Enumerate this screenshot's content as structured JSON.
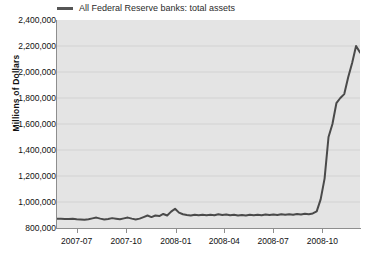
{
  "chart_data": {
    "type": "line",
    "title": "",
    "subtitle": "",
    "xlabel": "",
    "ylabel": "Millions of Dollars",
    "legend": {
      "position": "top-left",
      "entries": [
        {
          "name": "All Federal Reserve banks: total assets",
          "color": "#555555"
        }
      ]
    },
    "grid": {
      "horizontal": true,
      "vertical": false,
      "color": "#d2d2d2"
    },
    "plot_background": "#e4e4e4",
    "page_background": "#ffffff",
    "xlim": [
      "2007-06-06",
      "2008-11-26"
    ],
    "ylim": [
      800000,
      2400000
    ],
    "yticks": [
      "800,000",
      "1,000,000",
      "1,200,000",
      "1,400,000",
      "1,600,000",
      "1,800,000",
      "2,000,000",
      "2,200,000",
      "2,400,000"
    ],
    "ytick_values": [
      800000,
      1000000,
      1200000,
      1400000,
      1600000,
      1800000,
      2000000,
      2200000,
      2400000
    ],
    "xticks": [
      "2007-07",
      "2007-10",
      "2008-01",
      "2008-04",
      "2008-07",
      "2008-10"
    ],
    "xtick_positions": [
      0.065,
      0.228,
      0.392,
      0.552,
      0.713,
      0.876
    ],
    "series": [
      {
        "name": "All Federal Reserve banks: total assets",
        "color": "#4a4a4a",
        "line_width": 2,
        "x": [
          "2007-06-06",
          "2007-06-13",
          "2007-06-20",
          "2007-06-27",
          "2007-07-04",
          "2007-07-11",
          "2007-07-18",
          "2007-07-25",
          "2007-08-01",
          "2007-08-08",
          "2007-08-15",
          "2007-08-22",
          "2007-08-29",
          "2007-09-05",
          "2007-09-12",
          "2007-09-19",
          "2007-09-26",
          "2007-10-03",
          "2007-10-10",
          "2007-10-17",
          "2007-10-24",
          "2007-10-31",
          "2007-11-07",
          "2007-11-14",
          "2007-11-21",
          "2007-11-28",
          "2007-12-05",
          "2007-12-12",
          "2007-12-19",
          "2007-12-26",
          "2008-01-02",
          "2008-01-09",
          "2008-01-16",
          "2008-01-23",
          "2008-01-30",
          "2008-02-06",
          "2008-02-13",
          "2008-02-20",
          "2008-02-27",
          "2008-03-05",
          "2008-03-12",
          "2008-03-19",
          "2008-03-26",
          "2008-04-02",
          "2008-04-09",
          "2008-04-16",
          "2008-04-23",
          "2008-04-30",
          "2008-05-07",
          "2008-05-14",
          "2008-05-21",
          "2008-05-28",
          "2008-06-04",
          "2008-06-11",
          "2008-06-18",
          "2008-06-25",
          "2008-07-02",
          "2008-07-09",
          "2008-07-16",
          "2008-07-23",
          "2008-07-30",
          "2008-08-06",
          "2008-08-13",
          "2008-08-20",
          "2008-08-27",
          "2008-09-03",
          "2008-09-10",
          "2008-09-17",
          "2008-09-24",
          "2008-10-01",
          "2008-10-08",
          "2008-10-15",
          "2008-10-22",
          "2008-10-29",
          "2008-11-05",
          "2008-11-12",
          "2008-11-19",
          "2008-11-26"
        ],
        "y": [
          872000,
          871000,
          870000,
          869000,
          872000,
          868000,
          866000,
          864000,
          868000,
          874000,
          880000,
          872000,
          866000,
          870000,
          876000,
          872000,
          868000,
          874000,
          880000,
          872000,
          866000,
          872000,
          884000,
          896000,
          884000,
          896000,
          892000,
          908000,
          896000,
          926000,
          948000,
          918000,
          906000,
          900000,
          896000,
          902000,
          898000,
          902000,
          898000,
          902000,
          898000,
          906000,
          900000,
          904000,
          898000,
          902000,
          896000,
          900000,
          896000,
          902000,
          898000,
          902000,
          898000,
          904000,
          900000,
          904000,
          900000,
          906000,
          902000,
          906000,
          902000,
          908000,
          904000,
          910000,
          906000,
          912000,
          928000,
          1020000,
          1180000,
          1500000,
          1600000,
          1760000,
          1800000,
          1830000,
          1960000,
          2070000,
          2200000,
          2150000
        ]
      }
    ]
  }
}
